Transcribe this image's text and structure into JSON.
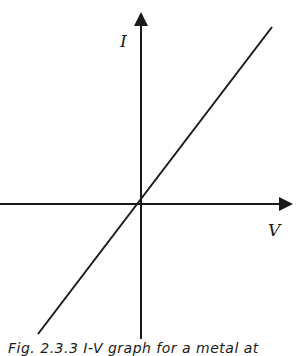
{
  "figure": {
    "type": "diagram",
    "axes": {
      "y_label": "I",
      "x_label": "V",
      "origin_px": [
        141,
        204
      ]
    },
    "line": {
      "description": "straight line through origin with positive slope",
      "start_px": [
        38,
        334
      ],
      "end_px": [
        272,
        27
      ]
    },
    "colors": {
      "ink": "#1a1a1a",
      "background": "#ffffff"
    },
    "caption": "Fig. 2.3.3 I-V graph for a metal at"
  }
}
